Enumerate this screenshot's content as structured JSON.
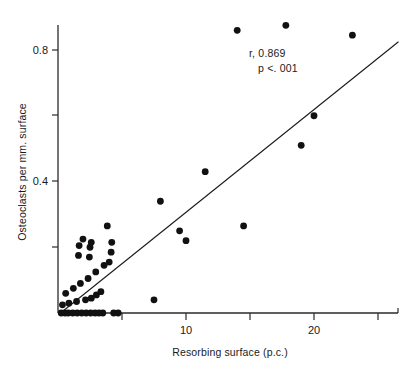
{
  "chart_data": {
    "type": "scatter",
    "title": "",
    "xlabel": "Resorbing surface (p.c.)",
    "ylabel": "Osteoclasts per mm. surface",
    "xlim": [
      0,
      27.5
    ],
    "ylim": [
      0,
      0.92
    ],
    "grid": false,
    "legend": false,
    "x_ticks": [
      5,
      10,
      15,
      20,
      25
    ],
    "x_tick_labels": [
      "",
      "10",
      "",
      "20",
      ""
    ],
    "y_ticks": [
      0,
      0.2,
      0.4,
      0.6,
      0.8
    ],
    "y_tick_labels": [
      "",
      "",
      "0.4",
      "",
      "0.8"
    ],
    "annotations": [
      {
        "name": "correlation-coefficient",
        "text": "r, 0.869"
      },
      {
        "name": "p-value",
        "text": "p <. 001"
      }
    ],
    "series": [
      {
        "name": "observations",
        "marker": "filled-circle",
        "color": "#111111",
        "points": [
          [
            0.25,
            0.0
          ],
          [
            0.55,
            0.0
          ],
          [
            0.8,
            0.0
          ],
          [
            1.15,
            0.0
          ],
          [
            1.5,
            0.0
          ],
          [
            1.85,
            0.0
          ],
          [
            2.2,
            0.0
          ],
          [
            2.55,
            0.0
          ],
          [
            2.9,
            0.0
          ],
          [
            3.2,
            0.0
          ],
          [
            3.5,
            0.0
          ],
          [
            4.35,
            0.0
          ],
          [
            4.7,
            0.0
          ],
          [
            0.35,
            0.025
          ],
          [
            0.85,
            0.03
          ],
          [
            1.45,
            0.035
          ],
          [
            2.15,
            0.04
          ],
          [
            2.6,
            0.045
          ],
          [
            3.0,
            0.055
          ],
          [
            3.35,
            0.065
          ],
          [
            0.6,
            0.06
          ],
          [
            1.2,
            0.075
          ],
          [
            1.75,
            0.09
          ],
          [
            2.35,
            0.105
          ],
          [
            2.95,
            0.125
          ],
          [
            3.6,
            0.145
          ],
          [
            1.6,
            0.175
          ],
          [
            2.45,
            0.17
          ],
          [
            1.65,
            0.205
          ],
          [
            2.5,
            0.2
          ],
          [
            1.95,
            0.225
          ],
          [
            2.6,
            0.215
          ],
          [
            4.0,
            0.155
          ],
          [
            4.15,
            0.185
          ],
          [
            4.2,
            0.215
          ],
          [
            3.85,
            0.265
          ],
          [
            7.5,
            0.04
          ],
          [
            8.0,
            0.34
          ],
          [
            9.5,
            0.25
          ],
          [
            10.0,
            0.22
          ],
          [
            11.5,
            0.43
          ],
          [
            14.5,
            0.265
          ],
          [
            14.0,
            0.86
          ],
          [
            17.8,
            0.875
          ],
          [
            19.0,
            0.51
          ],
          [
            20.0,
            0.6
          ],
          [
            23.0,
            0.845
          ]
        ]
      }
    ],
    "fit_line": {
      "name": "regression-line",
      "x0": 0.2,
      "y0": 0.0,
      "x1": 26.6,
      "y1": 0.825
    }
  }
}
